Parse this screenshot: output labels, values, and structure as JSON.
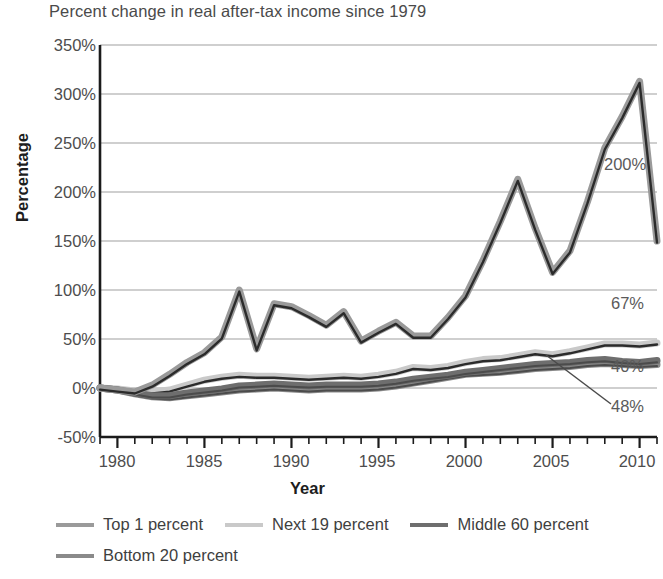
{
  "chart_data": {
    "type": "line",
    "title": "Percent change in real after-tax income since 1979",
    "xlabel": "Year",
    "ylabel": "Percentage",
    "xlim": [
      1979,
      2011
    ],
    "ylim": [
      -50,
      350
    ],
    "ytick_labels": [
      "350%",
      "300%",
      "250%",
      "200%",
      "150%",
      "100%",
      "50%",
      "0%",
      "-50%"
    ],
    "ytick_values": [
      350,
      300,
      250,
      200,
      150,
      100,
      50,
      0,
      -50
    ],
    "xtick_labels": [
      "1980",
      "1985",
      "1990",
      "1995",
      "2000",
      "2005",
      "2010"
    ],
    "xtick_values": [
      1980,
      1985,
      1990,
      1995,
      2000,
      2005,
      2010
    ],
    "grid": true,
    "legend_position": "below",
    "x": [
      1979,
      1980,
      1981,
      1982,
      1983,
      1984,
      1985,
      1986,
      1987,
      1988,
      1989,
      1990,
      1991,
      1992,
      1993,
      1994,
      1995,
      1996,
      1997,
      1998,
      1999,
      2000,
      2001,
      2002,
      2003,
      2004,
      2005,
      2006,
      2007,
      2008,
      2009,
      2010,
      2011
    ],
    "series": [
      {
        "name": "Top 1 percent",
        "color": "#9a9a9a",
        "values": [
          0,
          -2,
          -4,
          3,
          14,
          26,
          36,
          52,
          100,
          40,
          86,
          83,
          74,
          64,
          78,
          48,
          58,
          67,
          53,
          53,
          72,
          94,
          130,
          170,
          213,
          163,
          118,
          140,
          190,
          245,
          277,
          313,
          150
        ]
      },
      {
        "name": "Next 19 percent",
        "color": "#c9c9c9",
        "values": [
          0,
          -1,
          -3,
          -4,
          -2,
          3,
          8,
          11,
          13,
          12,
          12,
          11,
          10,
          11,
          12,
          11,
          13,
          16,
          21,
          20,
          22,
          26,
          29,
          30,
          33,
          36,
          34,
          37,
          41,
          45,
          45,
          44,
          46
        ]
      },
      {
        "name": "Middle 60 percent",
        "color": "#6e6e6e",
        "values": [
          0,
          -2,
          -5,
          -8,
          -8,
          -5,
          -3,
          -1,
          2,
          3,
          4,
          3,
          2,
          3,
          3,
          3,
          4,
          6,
          9,
          11,
          13,
          16,
          18,
          20,
          22,
          24,
          25,
          26,
          28,
          29,
          27,
          26,
          28
        ]
      },
      {
        "name": "Bottom 20 percent",
        "color": "#8a8a8a",
        "values": [
          0,
          -2,
          -6,
          -9,
          -10,
          -8,
          -6,
          -4,
          -2,
          -1,
          0,
          -1,
          -2,
          -1,
          -1,
          -1,
          0,
          2,
          5,
          8,
          11,
          14,
          15,
          16,
          18,
          20,
          21,
          22,
          24,
          25,
          24,
          23,
          24
        ]
      }
    ],
    "annotations": [
      {
        "label": "200%",
        "series": "Top 1 percent"
      },
      {
        "label": "67%",
        "series": "Next 19 percent"
      },
      {
        "label": "40%",
        "series": "Bottom 20 percent"
      },
      {
        "label": "48%",
        "series": "Middle 60 percent"
      }
    ]
  }
}
